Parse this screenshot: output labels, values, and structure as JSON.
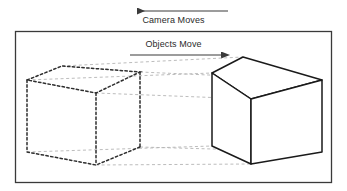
{
  "figure": {
    "type": "technical-diagram",
    "background_color": "#ffffff"
  },
  "annotations": {
    "camera": {
      "label": "Camera Moves",
      "arrow_direction": "left",
      "arrow_color": "#3a3a3a"
    },
    "objects": {
      "label": "Objects Move",
      "arrow_direction": "right",
      "arrow_color": "#3a3a3a"
    }
  },
  "frame": {
    "name": "scene-border",
    "stroke_color": "#3a3a3a"
  },
  "shapes": {
    "ghost_cube": {
      "name": "dashed-cube-left",
      "style": "dashed",
      "stroke_color": "#2e2e2e",
      "meaning": "previous object position"
    },
    "solid_cube": {
      "name": "solid-cube-right",
      "style": "solid",
      "stroke_color": "#1a1a1a",
      "fill_color": "#ffffff",
      "meaning": "current object position"
    },
    "connectors": {
      "name": "perspective-guide-lines",
      "style": "dashed",
      "stroke_color": "#b0b0b0"
    }
  }
}
